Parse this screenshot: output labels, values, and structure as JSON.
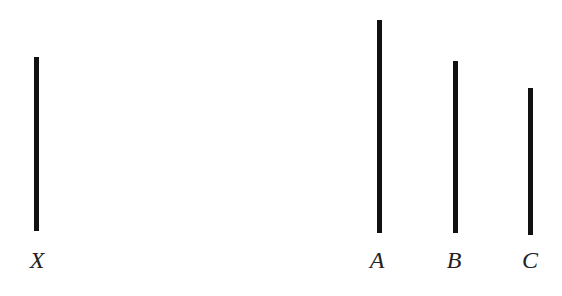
{
  "diagram": {
    "line_color": "#111111",
    "label_color": "#222222",
    "standard": {
      "label": "X",
      "x": 34,
      "top": 57,
      "bottom": 231
    },
    "comparisons": [
      {
        "label": "A",
        "x": 377,
        "top": 20,
        "bottom": 233
      },
      {
        "label": "B",
        "x": 453,
        "top": 61,
        "bottom": 233
      },
      {
        "label": "C",
        "x": 528,
        "top": 88,
        "bottom": 235
      }
    ]
  }
}
